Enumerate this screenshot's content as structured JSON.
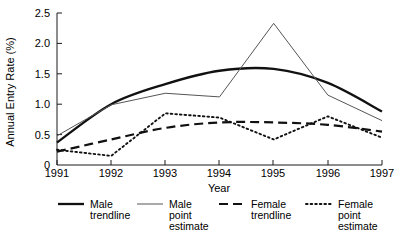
{
  "chart_data": {
    "type": "line",
    "title": "",
    "xlabel": "Year",
    "ylabel": "Annual Entry Rate (%)",
    "categories": [
      "1991",
      "1992",
      "1993",
      "1994",
      "1995",
      "1996",
      "1997"
    ],
    "x": [
      1991,
      1992,
      1993,
      1994,
      1995,
      1996,
      1997
    ],
    "xlim": [
      1991,
      1997
    ],
    "ylim": [
      0,
      2.5
    ],
    "yticks": [
      "0",
      "0.5",
      "1.0",
      "1.5",
      "2.0",
      "2.5"
    ],
    "ytick_values": [
      0,
      0.5,
      1.0,
      1.5,
      2.0,
      2.5
    ],
    "grid": false,
    "legend_position": "bottom",
    "series": [
      {
        "name": "Male trendline",
        "style": "solid-thick",
        "values": [
          0.37,
          1.0,
          1.33,
          1.55,
          1.58,
          1.35,
          0.88
        ]
      },
      {
        "name": "Male point estimate",
        "style": "solid-thin",
        "values": [
          0.48,
          0.99,
          1.18,
          1.12,
          2.33,
          1.15,
          0.73
        ]
      },
      {
        "name": "Female trendline",
        "style": "dashed",
        "values": [
          0.22,
          0.42,
          0.61,
          0.7,
          0.7,
          0.66,
          0.55
        ]
      },
      {
        "name": "Female point estimate",
        "style": "dotted",
        "values": [
          0.25,
          0.15,
          0.85,
          0.78,
          0.42,
          0.8,
          0.45
        ]
      }
    ]
  },
  "axes": {
    "ylabel": "Annual Entry Rate (%)",
    "xlabel": "Year",
    "ytick_labels": [
      "2.5",
      "2.0",
      "1.5",
      "1.0",
      "0.5",
      "0"
    ],
    "xtick_labels": [
      "1991",
      "1992",
      "1993",
      "1994",
      "1995",
      "1996",
      "1997"
    ]
  },
  "legend": {
    "entries": [
      {
        "line1": "Male",
        "line2": "trendline",
        "line3": ""
      },
      {
        "line1": "Male",
        "line2": "point",
        "line3": "estimate"
      },
      {
        "line1": "Female",
        "line2": "trendline",
        "line3": ""
      },
      {
        "line1": "Female",
        "line2": "point",
        "line3": "estimate"
      }
    ]
  }
}
